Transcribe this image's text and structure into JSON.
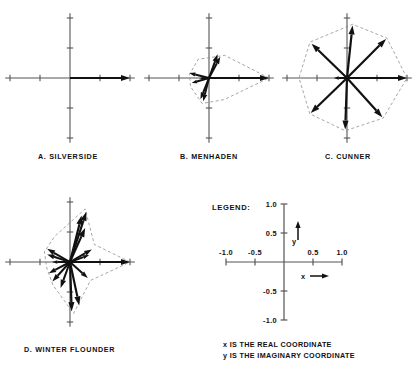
{
  "figure": {
    "type": "vector-phasor-diagrams",
    "background": "#ffffff",
    "ink_color": "#111111",
    "axis_color": "#555555",
    "envelope_color": "#888888"
  },
  "legend": {
    "title": "LEGEND:",
    "caption_line1": "x IS THE REAL COORDINATE",
    "caption_line2": "y IS THE IMAGINARY COORDINATE",
    "x_axis_label": "x",
    "y_axis_label": "y",
    "x_ticks": [
      "-1.0",
      "-0.5",
      "0.5",
      "1.0"
    ],
    "y_ticks": [
      "1.0",
      "0.5",
      "-0.5",
      "-1.0"
    ]
  },
  "panels": [
    {
      "id": "a",
      "label": "A.  SILVERSIDE",
      "species": "SILVERSIDE",
      "letter": "A",
      "center": {
        "x": 68,
        "y": 84
      },
      "radius": 60,
      "has_envelope": false,
      "vectors": [
        {
          "angle_deg": 0,
          "magnitude": 1.0
        }
      ],
      "envelope": []
    },
    {
      "id": "b",
      "label": "B.  MENHADEN",
      "species": "MENHADEN",
      "letter": "B",
      "center": {
        "x": 207,
        "y": 84
      },
      "radius": 60,
      "has_envelope": true,
      "vectors": [
        {
          "angle_deg": 0,
          "magnitude": 1.0
        },
        {
          "angle_deg": 70,
          "magnitude": 0.42
        },
        {
          "angle_deg": 62,
          "magnitude": 0.4
        },
        {
          "angle_deg": 166,
          "magnitude": 0.34
        },
        {
          "angle_deg": 182,
          "magnitude": 0.16
        },
        {
          "angle_deg": 248,
          "magnitude": 0.38
        },
        {
          "angle_deg": 256,
          "magnitude": 0.4
        },
        {
          "angle_deg": 196,
          "magnitude": 0.3
        }
      ],
      "envelope": [
        {
          "angle_deg": 0,
          "magnitude": 1.0
        },
        {
          "angle_deg": 55,
          "magnitude": 0.46
        },
        {
          "angle_deg": 120,
          "magnitude": 0.36
        },
        {
          "angle_deg": 170,
          "magnitude": 0.33
        },
        {
          "angle_deg": 205,
          "magnitude": 0.34
        },
        {
          "angle_deg": 255,
          "magnitude": 0.44
        },
        {
          "angle_deg": 305,
          "magnitude": 0.44
        }
      ]
    },
    {
      "id": "c",
      "label": "C.  CUNNER",
      "species": "CUNNER",
      "letter": "C",
      "center": {
        "x": 345,
        "y": 84
      },
      "radius": 60,
      "has_envelope": true,
      "vectors": [
        {
          "angle_deg": 0,
          "magnitude": 1.0
        },
        {
          "angle_deg": 45,
          "magnitude": 0.92
        },
        {
          "angle_deg": 84,
          "magnitude": 0.88
        },
        {
          "angle_deg": 136,
          "magnitude": 0.82
        },
        {
          "angle_deg": 180,
          "magnitude": 0.22
        },
        {
          "angle_deg": 224,
          "magnitude": 0.84
        },
        {
          "angle_deg": 268,
          "magnitude": 0.86
        },
        {
          "angle_deg": 312,
          "magnitude": 0.88
        }
      ],
      "envelope": [
        {
          "angle_deg": 0,
          "magnitude": 1.0
        },
        {
          "angle_deg": 45,
          "magnitude": 0.94
        },
        {
          "angle_deg": 84,
          "magnitude": 0.9
        },
        {
          "angle_deg": 136,
          "magnitude": 0.86
        },
        {
          "angle_deg": 180,
          "magnitude": 0.8
        },
        {
          "angle_deg": 224,
          "magnitude": 0.86
        },
        {
          "angle_deg": 268,
          "magnitude": 0.88
        },
        {
          "angle_deg": 312,
          "magnitude": 0.9
        }
      ]
    },
    {
      "id": "d",
      "label": "D.  WINTER  FLOUNDER",
      "species": "WINTER FLOUNDER",
      "letter": "D",
      "center": {
        "x": 68,
        "y": 268
      },
      "radius": 60,
      "has_envelope": true,
      "vectors": [
        {
          "angle_deg": 0,
          "magnitude": 1.0
        },
        {
          "angle_deg": 72,
          "magnitude": 0.88
        },
        {
          "angle_deg": 76,
          "magnitude": 0.8
        },
        {
          "angle_deg": 66,
          "magnitude": 0.62
        },
        {
          "angle_deg": 30,
          "magnitude": 0.42
        },
        {
          "angle_deg": 20,
          "magnitude": 0.34
        },
        {
          "angle_deg": 150,
          "magnitude": 0.44
        },
        {
          "angle_deg": 162,
          "magnitude": 0.4
        },
        {
          "angle_deg": 180,
          "magnitude": 0.3
        },
        {
          "angle_deg": 208,
          "magnitude": 0.4
        },
        {
          "angle_deg": 228,
          "magnitude": 0.44
        },
        {
          "angle_deg": 250,
          "magnitude": 0.46
        },
        {
          "angle_deg": 272,
          "magnitude": 0.82
        },
        {
          "angle_deg": 282,
          "magnitude": 0.74
        },
        {
          "angle_deg": 318,
          "magnitude": 0.4
        }
      ],
      "envelope": [
        {
          "angle_deg": 0,
          "magnitude": 1.0
        },
        {
          "angle_deg": 36,
          "magnitude": 0.5
        },
        {
          "angle_deg": 74,
          "magnitude": 0.92
        },
        {
          "angle_deg": 120,
          "magnitude": 0.5
        },
        {
          "angle_deg": 158,
          "magnitude": 0.46
        },
        {
          "angle_deg": 196,
          "magnitude": 0.4
        },
        {
          "angle_deg": 234,
          "magnitude": 0.48
        },
        {
          "angle_deg": 274,
          "magnitude": 0.86
        },
        {
          "angle_deg": 318,
          "magnitude": 0.46
        }
      ]
    }
  ],
  "chart_data": {
    "type": "scatter",
    "title": "",
    "xlabel": "x (real coordinate)",
    "ylabel": "y (imaginary coordinate)",
    "xlim": [
      -1.0,
      1.0
    ],
    "ylim": [
      -1.0,
      1.0
    ],
    "grid": false,
    "legend_position": "bottom-right",
    "note": "Four polar vector (phasor) plots in the complex plane; each arrow is a unit-normalized vector from the origin. Dashed outlines are envelope polygons connecting vector tips.",
    "series": [
      {
        "name": "A. SILVERSIDE",
        "vector_count": 1,
        "angles_deg": [
          0
        ],
        "magnitudes": [
          1.0
        ]
      },
      {
        "name": "B. MENHADEN",
        "vector_count": 8,
        "angles_deg": [
          0,
          70,
          62,
          166,
          182,
          248,
          256,
          196
        ],
        "magnitudes": [
          1.0,
          0.42,
          0.4,
          0.34,
          0.16,
          0.38,
          0.4,
          0.3
        ]
      },
      {
        "name": "C. CUNNER",
        "vector_count": 8,
        "angles_deg": [
          0,
          45,
          84,
          136,
          180,
          224,
          268,
          312
        ],
        "magnitudes": [
          1.0,
          0.92,
          0.88,
          0.82,
          0.22,
          0.84,
          0.86,
          0.88
        ]
      },
      {
        "name": "D. WINTER FLOUNDER",
        "vector_count": 15,
        "angles_deg": [
          0,
          72,
          76,
          66,
          30,
          20,
          150,
          162,
          180,
          208,
          228,
          250,
          272,
          282,
          318
        ],
        "magnitudes": [
          1.0,
          0.88,
          0.8,
          0.62,
          0.42,
          0.34,
          0.44,
          0.4,
          0.3,
          0.4,
          0.44,
          0.46,
          0.82,
          0.74,
          0.4
        ]
      }
    ]
  }
}
